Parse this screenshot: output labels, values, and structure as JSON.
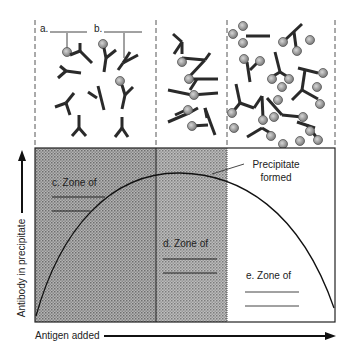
{
  "top_panels": {
    "blank_a_label": "a.",
    "blank_b_label": "b.",
    "panels": [
      {
        "name": "antibody-excess",
        "x": 35,
        "width": 121
      },
      {
        "name": "equivalence",
        "x": 156,
        "width": 71
      },
      {
        "name": "antigen-excess",
        "x": 227,
        "width": 108
      }
    ]
  },
  "graph": {
    "y_axis_label": "Antibody in precipitate",
    "x_axis_label": "Antigen added",
    "curve_annotation": "Precipitate formed",
    "curve_annotation_line2": "",
    "zones": [
      {
        "id": "c",
        "label": "c. Zone of",
        "fill": "#9a9a9a"
      },
      {
        "id": "d",
        "label": "d. Zone of",
        "fill": "#a8a8a8"
      },
      {
        "id": "e",
        "label": "e. Zone of",
        "fill": "#ffffff"
      }
    ]
  },
  "colors": {
    "line": "#1a1a1a",
    "antigen": "#9c9c9c",
    "antibody": "#2a2a2a"
  }
}
